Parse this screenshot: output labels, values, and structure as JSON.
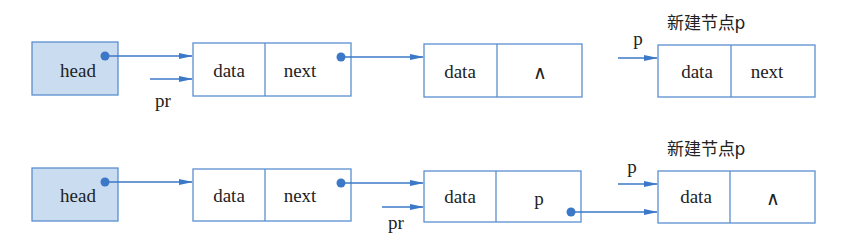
{
  "colors": {
    "line": "#3b78c8",
    "head_fill": "#cadcf0",
    "box_border": "#5a8fd0",
    "text": "#222222"
  },
  "row1": {
    "head": "head",
    "node1": {
      "data": "data",
      "next": "next"
    },
    "node2": {
      "data": "data",
      "next": "∧"
    },
    "new_node_caption": "新建节点p",
    "new_node_pointer": "p",
    "node3": {
      "data": "data",
      "next": "next"
    },
    "pr_label": "pr"
  },
  "row2": {
    "head": "head",
    "node1": {
      "data": "data",
      "next": "next"
    },
    "node2": {
      "data": "data",
      "next": "p"
    },
    "new_node_caption": "新建节点p",
    "new_node_pointer": "p",
    "node3": {
      "data": "data",
      "next": "∧"
    },
    "pr_label": "pr"
  }
}
